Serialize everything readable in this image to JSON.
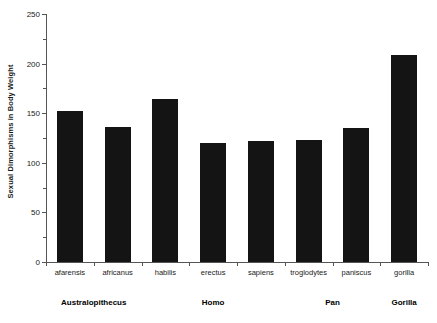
{
  "chart_data": {
    "type": "bar",
    "title": "",
    "xlabel": "",
    "ylabel": "Sexual Dimorphisms in Body Weight",
    "ylim": [
      0,
      250
    ],
    "ytick_labels": [
      "0",
      "50",
      "100",
      "150",
      "200",
      "250"
    ],
    "ytick_values": [
      0,
      50,
      100,
      150,
      200,
      250
    ],
    "yminor_values": [
      25,
      75,
      125,
      175,
      225
    ],
    "grid": false,
    "legend": "none",
    "bar_color": "#141414",
    "axis_color": "#555555",
    "categories": [
      "afarensis",
      "africanus",
      "habilis",
      "erectus",
      "sapiens",
      "troglodytes",
      "paniscus",
      "gorilla"
    ],
    "values": [
      152,
      136,
      164,
      120,
      122,
      123,
      135,
      209
    ],
    "groups": [
      {
        "label": "Australopithecus",
        "members": [
          "afarensis",
          "africanus"
        ]
      },
      {
        "label": "Homo",
        "members": [
          "habilis",
          "erectus",
          "sapiens"
        ]
      },
      {
        "label": "Pan",
        "members": [
          "troglodytes",
          "paniscus"
        ]
      },
      {
        "label": "Gorilla",
        "members": [
          "gorilla"
        ]
      }
    ]
  }
}
